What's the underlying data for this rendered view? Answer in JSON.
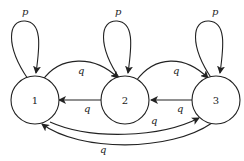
{
  "diagram": {
    "type": "state-transition-diagram",
    "nodes": [
      {
        "id": "1",
        "label": "1"
      },
      {
        "id": "2",
        "label": "2"
      },
      {
        "id": "3",
        "label": "3"
      }
    ],
    "edges": [
      {
        "from": "1",
        "to": "1",
        "label": "p"
      },
      {
        "from": "2",
        "to": "2",
        "label": "p"
      },
      {
        "from": "3",
        "to": "3",
        "label": "p"
      },
      {
        "from": "1",
        "to": "2",
        "label": "q"
      },
      {
        "from": "2",
        "to": "3",
        "label": "q"
      },
      {
        "from": "2",
        "to": "1",
        "label": "q"
      },
      {
        "from": "3",
        "to": "2",
        "label": "q"
      },
      {
        "from": "1",
        "to": "3",
        "label": "q"
      },
      {
        "from": "3",
        "to": "1",
        "label": "q"
      }
    ]
  }
}
